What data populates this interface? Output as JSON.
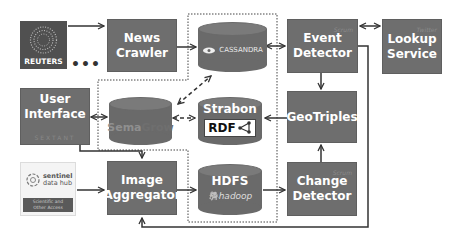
{
  "diagram": {
    "sources": {
      "reuters": {
        "label": "REUTERS"
      },
      "more": {
        "label": "•••"
      },
      "sentinel": {
        "line1": "sentinel",
        "line2": "data hub",
        "band1": "Scientific and",
        "band2": "Other Access"
      }
    },
    "components": {
      "news_crawler": {
        "line1": "News",
        "line2": "Crawler"
      },
      "event_detector": {
        "line1": "Event",
        "line2": "Detector",
        "tag": "Scrum"
      },
      "lookup_service": {
        "line1": "Lookup",
        "line2": "Service",
        "tag": "Twitter"
      },
      "user_interface": {
        "line1": "User",
        "line2": "Interface",
        "tag": "SEXTANT"
      },
      "geotriples": {
        "label": "GeoTriples"
      },
      "image_aggregator": {
        "line1": "Image",
        "line2": "Aggregator"
      },
      "change_detector": {
        "line1": "Change",
        "line2": "Detector",
        "tag": "Scrum"
      }
    },
    "stores": {
      "cassandra": {
        "label": "CASSANDRA"
      },
      "semagrow": {
        "label_a": "Sema",
        "label_b": "Grow"
      },
      "strabon": {
        "title": "Strabon",
        "rdf": "RDF"
      },
      "hdfs": {
        "title": "HDFS",
        "label": "hadoop"
      }
    },
    "colors": {
      "box": "#6e6e6e",
      "cylinder": "#6a6a6a",
      "line": "#333333",
      "background": "#ffffff"
    }
  }
}
